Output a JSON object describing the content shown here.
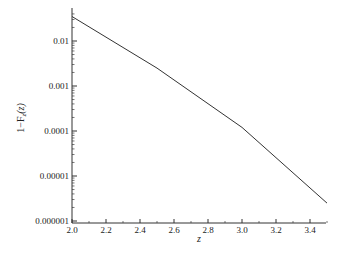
{
  "chart_data": {
    "type": "line",
    "title": "",
    "xlabel": "z",
    "ylabel": "1−F_z(z)",
    "ylabel_main": "1−F",
    "ylabel_sub": "z",
    "ylabel_arg": "(z)",
    "yscale": "log",
    "xlim": [
      2.0,
      3.5
    ],
    "ylim": [
      1e-06,
      0.04
    ],
    "grid": false,
    "legend": null,
    "x_ticks": [
      "2.0",
      "2.2",
      "2.4",
      "2.6",
      "2.8",
      "3.0",
      "3.2",
      "3.4"
    ],
    "y_ticks": [
      "0.01",
      "0.001",
      "0.0001",
      "0.00001",
      "0.000001"
    ],
    "series": [
      {
        "name": "1-F_z(z)",
        "color": "#333333",
        "x": [
          2.0,
          2.5,
          3.0,
          3.5
        ],
        "values": [
          0.035,
          0.0025,
          0.00012,
          2.5e-06
        ]
      }
    ]
  }
}
